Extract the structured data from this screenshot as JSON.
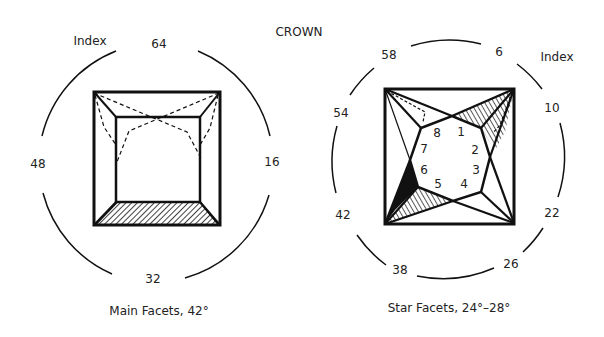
{
  "title": "CROWN",
  "left_diagram": {
    "index_label": "Index",
    "caption": "Main Facets, 42°",
    "index_numbers": [
      "64",
      "16",
      "32",
      "48"
    ]
  },
  "right_diagram": {
    "index_label": "Index",
    "caption": "Star Facets, 24°–28°",
    "index_numbers": [
      "6",
      "10",
      "22",
      "26",
      "38",
      "42",
      "54",
      "58"
    ],
    "facet_numbers": [
      "1",
      "2",
      "3",
      "4",
      "5",
      "6",
      "7",
      "8"
    ]
  },
  "colors": {
    "line": "#111111",
    "background": "#ffffff"
  }
}
